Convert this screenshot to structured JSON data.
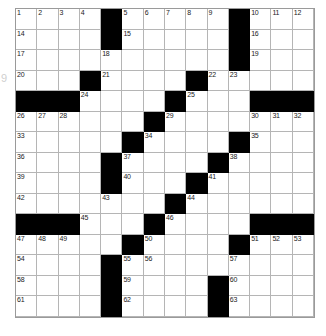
{
  "puzzle": {
    "title": "Crossword Grid",
    "margin_label": "9",
    "colors": {
      "block": "#000000",
      "open": "#ffffff",
      "rule": "#9a9a9a",
      "number": "#1a1a1a"
    },
    "grid": {
      "columns": 14,
      "rows": 15,
      "cell_size_px": 21
    },
    "cells": [
      {
        "r": 0,
        "c": 0,
        "b": false,
        "n": "1"
      },
      {
        "r": 0,
        "c": 1,
        "b": false,
        "n": "2"
      },
      {
        "r": 0,
        "c": 2,
        "b": false,
        "n": "3"
      },
      {
        "r": 0,
        "c": 3,
        "b": false,
        "n": "4"
      },
      {
        "r": 0,
        "c": 4,
        "b": true,
        "n": ""
      },
      {
        "r": 0,
        "c": 5,
        "b": false,
        "n": "5"
      },
      {
        "r": 0,
        "c": 6,
        "b": false,
        "n": "6"
      },
      {
        "r": 0,
        "c": 7,
        "b": false,
        "n": "7"
      },
      {
        "r": 0,
        "c": 8,
        "b": false,
        "n": "8"
      },
      {
        "r": 0,
        "c": 9,
        "b": false,
        "n": "9"
      },
      {
        "r": 0,
        "c": 10,
        "b": true,
        "n": ""
      },
      {
        "r": 0,
        "c": 11,
        "b": false,
        "n": "10"
      },
      {
        "r": 0,
        "c": 12,
        "b": false,
        "n": "11"
      },
      {
        "r": 0,
        "c": 13,
        "b": false,
        "n": "12"
      },
      {
        "r": 1,
        "c": 0,
        "b": false,
        "n": "14"
      },
      {
        "r": 1,
        "c": 1,
        "b": false,
        "n": ""
      },
      {
        "r": 1,
        "c": 2,
        "b": false,
        "n": ""
      },
      {
        "r": 1,
        "c": 3,
        "b": false,
        "n": ""
      },
      {
        "r": 1,
        "c": 4,
        "b": true,
        "n": ""
      },
      {
        "r": 1,
        "c": 5,
        "b": false,
        "n": "15"
      },
      {
        "r": 1,
        "c": 6,
        "b": false,
        "n": ""
      },
      {
        "r": 1,
        "c": 7,
        "b": false,
        "n": ""
      },
      {
        "r": 1,
        "c": 8,
        "b": false,
        "n": ""
      },
      {
        "r": 1,
        "c": 9,
        "b": false,
        "n": ""
      },
      {
        "r": 1,
        "c": 10,
        "b": true,
        "n": ""
      },
      {
        "r": 1,
        "c": 11,
        "b": false,
        "n": "16"
      },
      {
        "r": 1,
        "c": 12,
        "b": false,
        "n": ""
      },
      {
        "r": 1,
        "c": 13,
        "b": false,
        "n": ""
      },
      {
        "r": 2,
        "c": 0,
        "b": false,
        "n": "17"
      },
      {
        "r": 2,
        "c": 1,
        "b": false,
        "n": ""
      },
      {
        "r": 2,
        "c": 2,
        "b": false,
        "n": ""
      },
      {
        "r": 2,
        "c": 3,
        "b": false,
        "n": ""
      },
      {
        "r": 2,
        "c": 4,
        "b": false,
        "n": "18"
      },
      {
        "r": 2,
        "c": 5,
        "b": false,
        "n": ""
      },
      {
        "r": 2,
        "c": 6,
        "b": false,
        "n": ""
      },
      {
        "r": 2,
        "c": 7,
        "b": false,
        "n": ""
      },
      {
        "r": 2,
        "c": 8,
        "b": false,
        "n": ""
      },
      {
        "r": 2,
        "c": 9,
        "b": false,
        "n": ""
      },
      {
        "r": 2,
        "c": 10,
        "b": true,
        "n": ""
      },
      {
        "r": 2,
        "c": 11,
        "b": false,
        "n": "19"
      },
      {
        "r": 2,
        "c": 12,
        "b": false,
        "n": ""
      },
      {
        "r": 2,
        "c": 13,
        "b": false,
        "n": ""
      },
      {
        "r": 3,
        "c": 0,
        "b": false,
        "n": "20"
      },
      {
        "r": 3,
        "c": 1,
        "b": false,
        "n": ""
      },
      {
        "r": 3,
        "c": 2,
        "b": false,
        "n": ""
      },
      {
        "r": 3,
        "c": 3,
        "b": true,
        "n": ""
      },
      {
        "r": 3,
        "c": 4,
        "b": false,
        "n": "21"
      },
      {
        "r": 3,
        "c": 5,
        "b": false,
        "n": ""
      },
      {
        "r": 3,
        "c": 6,
        "b": false,
        "n": ""
      },
      {
        "r": 3,
        "c": 7,
        "b": false,
        "n": ""
      },
      {
        "r": 3,
        "c": 8,
        "b": true,
        "n": ""
      },
      {
        "r": 3,
        "c": 9,
        "b": false,
        "n": "22"
      },
      {
        "r": 3,
        "c": 10,
        "b": false,
        "n": "23"
      },
      {
        "r": 3,
        "c": 11,
        "b": false,
        "n": ""
      },
      {
        "r": 3,
        "c": 12,
        "b": false,
        "n": ""
      },
      {
        "r": 3,
        "c": 13,
        "b": false,
        "n": ""
      },
      {
        "r": 4,
        "c": 0,
        "b": true,
        "n": ""
      },
      {
        "r": 4,
        "c": 1,
        "b": true,
        "n": ""
      },
      {
        "r": 4,
        "c": 2,
        "b": true,
        "n": ""
      },
      {
        "r": 4,
        "c": 3,
        "b": false,
        "n": "24"
      },
      {
        "r": 4,
        "c": 4,
        "b": false,
        "n": ""
      },
      {
        "r": 4,
        "c": 5,
        "b": false,
        "n": ""
      },
      {
        "r": 4,
        "c": 6,
        "b": false,
        "n": ""
      },
      {
        "r": 4,
        "c": 7,
        "b": true,
        "n": ""
      },
      {
        "r": 4,
        "c": 8,
        "b": false,
        "n": "25"
      },
      {
        "r": 4,
        "c": 9,
        "b": false,
        "n": ""
      },
      {
        "r": 4,
        "c": 10,
        "b": false,
        "n": ""
      },
      {
        "r": 4,
        "c": 11,
        "b": true,
        "n": ""
      },
      {
        "r": 4,
        "c": 12,
        "b": true,
        "n": ""
      },
      {
        "r": 4,
        "c": 13,
        "b": true,
        "n": ""
      },
      {
        "r": 5,
        "c": 0,
        "b": false,
        "n": "26"
      },
      {
        "r": 5,
        "c": 1,
        "b": false,
        "n": "27"
      },
      {
        "r": 5,
        "c": 2,
        "b": false,
        "n": "28"
      },
      {
        "r": 5,
        "c": 3,
        "b": false,
        "n": ""
      },
      {
        "r": 5,
        "c": 4,
        "b": false,
        "n": ""
      },
      {
        "r": 5,
        "c": 5,
        "b": false,
        "n": ""
      },
      {
        "r": 5,
        "c": 6,
        "b": true,
        "n": ""
      },
      {
        "r": 5,
        "c": 7,
        "b": false,
        "n": "29"
      },
      {
        "r": 5,
        "c": 8,
        "b": false,
        "n": ""
      },
      {
        "r": 5,
        "c": 9,
        "b": false,
        "n": ""
      },
      {
        "r": 5,
        "c": 10,
        "b": false,
        "n": ""
      },
      {
        "r": 5,
        "c": 11,
        "b": false,
        "n": "30"
      },
      {
        "r": 5,
        "c": 12,
        "b": false,
        "n": "31"
      },
      {
        "r": 5,
        "c": 13,
        "b": false,
        "n": "32"
      },
      {
        "r": 6,
        "c": 0,
        "b": false,
        "n": "33"
      },
      {
        "r": 6,
        "c": 1,
        "b": false,
        "n": ""
      },
      {
        "r": 6,
        "c": 2,
        "b": false,
        "n": ""
      },
      {
        "r": 6,
        "c": 3,
        "b": false,
        "n": ""
      },
      {
        "r": 6,
        "c": 4,
        "b": false,
        "n": ""
      },
      {
        "r": 6,
        "c": 5,
        "b": true,
        "n": ""
      },
      {
        "r": 6,
        "c": 6,
        "b": false,
        "n": "34"
      },
      {
        "r": 6,
        "c": 7,
        "b": false,
        "n": ""
      },
      {
        "r": 6,
        "c": 8,
        "b": false,
        "n": ""
      },
      {
        "r": 6,
        "c": 9,
        "b": false,
        "n": ""
      },
      {
        "r": 6,
        "c": 10,
        "b": true,
        "n": ""
      },
      {
        "r": 6,
        "c": 11,
        "b": false,
        "n": "35"
      },
      {
        "r": 6,
        "c": 12,
        "b": false,
        "n": ""
      },
      {
        "r": 6,
        "c": 13,
        "b": false,
        "n": ""
      },
      {
        "r": 7,
        "c": 0,
        "b": false,
        "n": "36"
      },
      {
        "r": 7,
        "c": 1,
        "b": false,
        "n": ""
      },
      {
        "r": 7,
        "c": 2,
        "b": false,
        "n": ""
      },
      {
        "r": 7,
        "c": 3,
        "b": false,
        "n": ""
      },
      {
        "r": 7,
        "c": 4,
        "b": true,
        "n": ""
      },
      {
        "r": 7,
        "c": 5,
        "b": false,
        "n": "37"
      },
      {
        "r": 7,
        "c": 6,
        "b": false,
        "n": ""
      },
      {
        "r": 7,
        "c": 7,
        "b": false,
        "n": ""
      },
      {
        "r": 7,
        "c": 8,
        "b": false,
        "n": ""
      },
      {
        "r": 7,
        "c": 9,
        "b": true,
        "n": ""
      },
      {
        "r": 7,
        "c": 10,
        "b": false,
        "n": "38"
      },
      {
        "r": 7,
        "c": 11,
        "b": false,
        "n": ""
      },
      {
        "r": 7,
        "c": 12,
        "b": false,
        "n": ""
      },
      {
        "r": 7,
        "c": 13,
        "b": false,
        "n": ""
      },
      {
        "r": 8,
        "c": 0,
        "b": false,
        "n": "39"
      },
      {
        "r": 8,
        "c": 1,
        "b": false,
        "n": ""
      },
      {
        "r": 8,
        "c": 2,
        "b": false,
        "n": ""
      },
      {
        "r": 8,
        "c": 3,
        "b": false,
        "n": ""
      },
      {
        "r": 8,
        "c": 4,
        "b": true,
        "n": ""
      },
      {
        "r": 8,
        "c": 5,
        "b": false,
        "n": "40"
      },
      {
        "r": 8,
        "c": 6,
        "b": false,
        "n": ""
      },
      {
        "r": 8,
        "c": 7,
        "b": false,
        "n": ""
      },
      {
        "r": 8,
        "c": 8,
        "b": true,
        "n": ""
      },
      {
        "r": 8,
        "c": 9,
        "b": false,
        "n": "41"
      },
      {
        "r": 8,
        "c": 10,
        "b": false,
        "n": ""
      },
      {
        "r": 8,
        "c": 11,
        "b": false,
        "n": ""
      },
      {
        "r": 8,
        "c": 12,
        "b": false,
        "n": ""
      },
      {
        "r": 8,
        "c": 13,
        "b": false,
        "n": ""
      },
      {
        "r": 9,
        "c": 0,
        "b": false,
        "n": "42"
      },
      {
        "r": 9,
        "c": 1,
        "b": false,
        "n": ""
      },
      {
        "r": 9,
        "c": 2,
        "b": false,
        "n": ""
      },
      {
        "r": 9,
        "c": 3,
        "b": false,
        "n": ""
      },
      {
        "r": 9,
        "c": 4,
        "b": false,
        "n": "43"
      },
      {
        "r": 9,
        "c": 5,
        "b": false,
        "n": ""
      },
      {
        "r": 9,
        "c": 6,
        "b": false,
        "n": ""
      },
      {
        "r": 9,
        "c": 7,
        "b": true,
        "n": ""
      },
      {
        "r": 9,
        "c": 8,
        "b": false,
        "n": "44"
      },
      {
        "r": 9,
        "c": 9,
        "b": false,
        "n": ""
      },
      {
        "r": 9,
        "c": 10,
        "b": false,
        "n": ""
      },
      {
        "r": 9,
        "c": 11,
        "b": false,
        "n": ""
      },
      {
        "r": 9,
        "c": 12,
        "b": false,
        "n": ""
      },
      {
        "r": 9,
        "c": 13,
        "b": false,
        "n": ""
      },
      {
        "r": 10,
        "c": 0,
        "b": true,
        "n": ""
      },
      {
        "r": 10,
        "c": 1,
        "b": true,
        "n": ""
      },
      {
        "r": 10,
        "c": 2,
        "b": true,
        "n": ""
      },
      {
        "r": 10,
        "c": 3,
        "b": false,
        "n": "45"
      },
      {
        "r": 10,
        "c": 4,
        "b": false,
        "n": ""
      },
      {
        "r": 10,
        "c": 5,
        "b": false,
        "n": ""
      },
      {
        "r": 10,
        "c": 6,
        "b": true,
        "n": ""
      },
      {
        "r": 10,
        "c": 7,
        "b": false,
        "n": "46"
      },
      {
        "r": 10,
        "c": 8,
        "b": false,
        "n": ""
      },
      {
        "r": 10,
        "c": 9,
        "b": false,
        "n": ""
      },
      {
        "r": 10,
        "c": 10,
        "b": false,
        "n": ""
      },
      {
        "r": 10,
        "c": 11,
        "b": true,
        "n": ""
      },
      {
        "r": 10,
        "c": 12,
        "b": true,
        "n": ""
      },
      {
        "r": 10,
        "c": 13,
        "b": true,
        "n": ""
      },
      {
        "r": 11,
        "c": 0,
        "b": false,
        "n": "47"
      },
      {
        "r": 11,
        "c": 1,
        "b": false,
        "n": "48"
      },
      {
        "r": 11,
        "c": 2,
        "b": false,
        "n": "49"
      },
      {
        "r": 11,
        "c": 3,
        "b": false,
        "n": ""
      },
      {
        "r": 11,
        "c": 4,
        "b": false,
        "n": ""
      },
      {
        "r": 11,
        "c": 5,
        "b": true,
        "n": ""
      },
      {
        "r": 11,
        "c": 6,
        "b": false,
        "n": "50"
      },
      {
        "r": 11,
        "c": 7,
        "b": false,
        "n": ""
      },
      {
        "r": 11,
        "c": 8,
        "b": false,
        "n": ""
      },
      {
        "r": 11,
        "c": 9,
        "b": false,
        "n": ""
      },
      {
        "r": 11,
        "c": 10,
        "b": true,
        "n": ""
      },
      {
        "r": 11,
        "c": 11,
        "b": false,
        "n": "51"
      },
      {
        "r": 11,
        "c": 12,
        "b": false,
        "n": "52"
      },
      {
        "r": 11,
        "c": 13,
        "b": false,
        "n": "53"
      },
      {
        "r": 12,
        "c": 0,
        "b": false,
        "n": "54"
      },
      {
        "r": 12,
        "c": 1,
        "b": false,
        "n": ""
      },
      {
        "r": 12,
        "c": 2,
        "b": false,
        "n": ""
      },
      {
        "r": 12,
        "c": 3,
        "b": false,
        "n": ""
      },
      {
        "r": 12,
        "c": 4,
        "b": true,
        "n": ""
      },
      {
        "r": 12,
        "c": 5,
        "b": false,
        "n": "55"
      },
      {
        "r": 12,
        "c": 6,
        "b": false,
        "n": "56"
      },
      {
        "r": 12,
        "c": 7,
        "b": false,
        "n": ""
      },
      {
        "r": 12,
        "c": 8,
        "b": false,
        "n": ""
      },
      {
        "r": 12,
        "c": 9,
        "b": false,
        "n": ""
      },
      {
        "r": 12,
        "c": 10,
        "b": false,
        "n": "57"
      },
      {
        "r": 12,
        "c": 11,
        "b": false,
        "n": ""
      },
      {
        "r": 12,
        "c": 12,
        "b": false,
        "n": ""
      },
      {
        "r": 12,
        "c": 13,
        "b": false,
        "n": ""
      },
      {
        "r": 13,
        "c": 0,
        "b": false,
        "n": "58"
      },
      {
        "r": 13,
        "c": 1,
        "b": false,
        "n": ""
      },
      {
        "r": 13,
        "c": 2,
        "b": false,
        "n": ""
      },
      {
        "r": 13,
        "c": 3,
        "b": false,
        "n": ""
      },
      {
        "r": 13,
        "c": 4,
        "b": true,
        "n": ""
      },
      {
        "r": 13,
        "c": 5,
        "b": false,
        "n": "59"
      },
      {
        "r": 13,
        "c": 6,
        "b": false,
        "n": ""
      },
      {
        "r": 13,
        "c": 7,
        "b": false,
        "n": ""
      },
      {
        "r": 13,
        "c": 8,
        "b": false,
        "n": ""
      },
      {
        "r": 13,
        "c": 9,
        "b": true,
        "n": ""
      },
      {
        "r": 13,
        "c": 10,
        "b": false,
        "n": "60"
      },
      {
        "r": 13,
        "c": 11,
        "b": false,
        "n": ""
      },
      {
        "r": 13,
        "c": 12,
        "b": false,
        "n": ""
      },
      {
        "r": 13,
        "c": 13,
        "b": false,
        "n": ""
      },
      {
        "r": 14,
        "c": 0,
        "b": false,
        "n": "61"
      },
      {
        "r": 14,
        "c": 1,
        "b": false,
        "n": ""
      },
      {
        "r": 14,
        "c": 2,
        "b": false,
        "n": ""
      },
      {
        "r": 14,
        "c": 3,
        "b": false,
        "n": ""
      },
      {
        "r": 14,
        "c": 4,
        "b": true,
        "n": ""
      },
      {
        "r": 14,
        "c": 5,
        "b": false,
        "n": "62"
      },
      {
        "r": 14,
        "c": 6,
        "b": false,
        "n": ""
      },
      {
        "r": 14,
        "c": 7,
        "b": false,
        "n": ""
      },
      {
        "r": 14,
        "c": 8,
        "b": false,
        "n": ""
      },
      {
        "r": 14,
        "c": 9,
        "b": true,
        "n": ""
      },
      {
        "r": 14,
        "c": 10,
        "b": false,
        "n": "63"
      },
      {
        "r": 14,
        "c": 11,
        "b": false,
        "n": ""
      },
      {
        "r": 14,
        "c": 12,
        "b": false,
        "n": ""
      },
      {
        "r": 14,
        "c": 13,
        "b": false,
        "n": ""
      }
    ]
  }
}
